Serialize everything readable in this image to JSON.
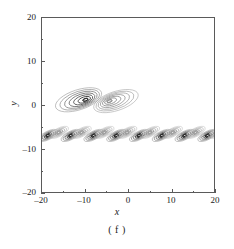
{
  "chart_data": {
    "type": "contour",
    "title": "",
    "subtitle": "",
    "panel_label": "( f )",
    "xlabel": "x",
    "ylabel": "y",
    "xlim": [
      -20,
      20
    ],
    "ylim": [
      -20,
      20
    ],
    "xticks": [
      -20,
      -10,
      0,
      10,
      20
    ],
    "yticks": [
      -20,
      -10,
      0,
      10,
      20
    ],
    "xtick_labels": [
      "–20",
      "–10",
      "0",
      "10",
      "20"
    ],
    "ytick_labels": [
      "–20",
      "–10",
      "0",
      "10",
      "20"
    ],
    "xminor_ticks": [
      -15,
      -5,
      5,
      15
    ],
    "yminor_ticks": [
      -15,
      -5,
      5,
      15
    ],
    "grid": false,
    "legend": "none",
    "tick_direction": "in",
    "frame_color": "#5a5a5a",
    "contour_color_dark": "#2b2b2b",
    "contour_color_light": "#b0b0b0",
    "features": [
      {
        "name": "upper-left-vortex",
        "cx": -11.5,
        "cy": 1.2,
        "semi_major": 5.6,
        "semi_minor": 2.3,
        "angle_deg": -18,
        "levels": 7,
        "core": "dark",
        "core_offset_x": 1.6
      },
      {
        "name": "upper-right-vortex",
        "cx": -2.8,
        "cy": 0.9,
        "semi_major": 5.4,
        "semi_minor": 2.2,
        "angle_deg": -18,
        "levels": 7,
        "core": "light",
        "core_offset_x": -1.5
      }
    ],
    "wave_train": {
      "name": "lower-periodic-blob-train",
      "y_center": -7.0,
      "x_start": -18.6,
      "period": 5.3,
      "count": 8,
      "pair_offset_x": 2.5,
      "pair_offset_y": 0.7,
      "semi_major": 2.5,
      "semi_minor": 0.95,
      "angle_deg": -27,
      "levels": 5,
      "dark_core": "#2b2b2b",
      "light_core": "#bdbdbd"
    }
  }
}
